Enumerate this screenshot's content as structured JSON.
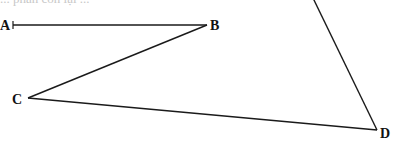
{
  "caption": {
    "text": "... phần còn lại ..."
  },
  "figure": {
    "stroke_color": "#1a1a1a",
    "points": {
      "A": {
        "label": "A",
        "x": 13,
        "y": 25
      },
      "B": {
        "label": "B",
        "x": 207,
        "y": 25
      },
      "C": {
        "label": "C",
        "x": 28,
        "y": 98
      },
      "D": {
        "label": "D",
        "x": 377,
        "y": 130
      }
    },
    "segments": [
      "AB",
      "BC",
      "CD",
      "D-up (extends beyond top edge)"
    ]
  }
}
